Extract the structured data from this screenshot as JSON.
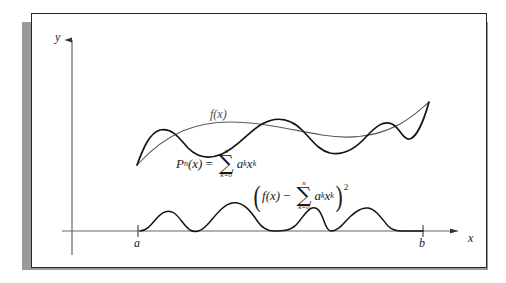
{
  "figure": {
    "kind": "least-squares-polynomial-approximation-diagram",
    "background_color": "#ffffff",
    "frame_border_color": "#262626",
    "frame_shadow_color": "#9a9a9a"
  },
  "axes": {
    "y_label": "y",
    "x_label": "x",
    "x_tick_left_label": "a",
    "x_tick_right_label": "b",
    "axis_color": "#555555",
    "x_axis_y": 231,
    "y_axis_x": 72
  },
  "curves": {
    "fx": {
      "label": "f(x)",
      "color": "#5a5a5a",
      "stroke_width": 1.1,
      "description": "smooth target function curve"
    },
    "pn": {
      "color": "#141414",
      "stroke_width": 1.7,
      "description": "oscillating polynomial approximation curve"
    },
    "error": {
      "color": "#141414",
      "stroke_width": 1.5,
      "description": "squared error bumps resting on the x-axis between a and b"
    }
  },
  "formulas": {
    "polynomial": {
      "lhs_p": "P",
      "lhs_sub_n": "n",
      "lhs_arg": "(x)",
      "equals": "=",
      "sum_upper": "n",
      "sum_symbol": "∑",
      "sum_lower": "k=0",
      "coef": "a",
      "coef_sub": "k",
      "var": "x",
      "var_sup": "k",
      "plain": "P_n(x) = ∑_{k=0}^{n} a_k x^k"
    },
    "squared_error": {
      "open_paren": "(",
      "f_term": "f",
      "f_arg": "(x)",
      "minus": "−",
      "sum_upper": "n",
      "sum_symbol": "∑",
      "sum_lower": "k=0",
      "coef": "a",
      "coef_sub": "k",
      "var": "x",
      "var_sup": "k",
      "close_paren": ")",
      "power": "2",
      "plain": "(f(x) − ∑_{k=0}^{n} a_k x^k)^2"
    }
  },
  "geometry": {
    "fx_path": "M137,165 C168,131 198,122 230,122 C262,122 292,130 322,135 C352,140 378,136 400,124 C416,115 424,106 429,102",
    "pn_path": "M137,165 C144,146 150,133 160,130 C172,127 180,139 188,148 C197,157 208,160 222,154 C238,147 248,132 262,124 C278,115 292,120 302,130 C312,140 318,150 330,153 C344,156 356,148 366,137 C376,126 384,120 392,124 C400,128 402,138 408,139 C416,140 424,120 429,102",
    "error_path": "M140,231 C146,231 150,226 156,219 C162,212 168,209 174,213 C180,217 184,226 190,230 C195,233 200,232 206,226 C214,218 222,205 232,203 C244,201 252,213 258,222 C263,229 268,231 274,231 C282,231 290,231 296,225 C302,219 306,210 312,208 C318,206 321,213 324,221 C326,227 328,231 331,231 C336,231 340,228 345,222 C352,214 360,207 368,208 C376,209 382,219 388,226 C392,230 396,231 402,231 C410,231 418,231 423,231"
  }
}
